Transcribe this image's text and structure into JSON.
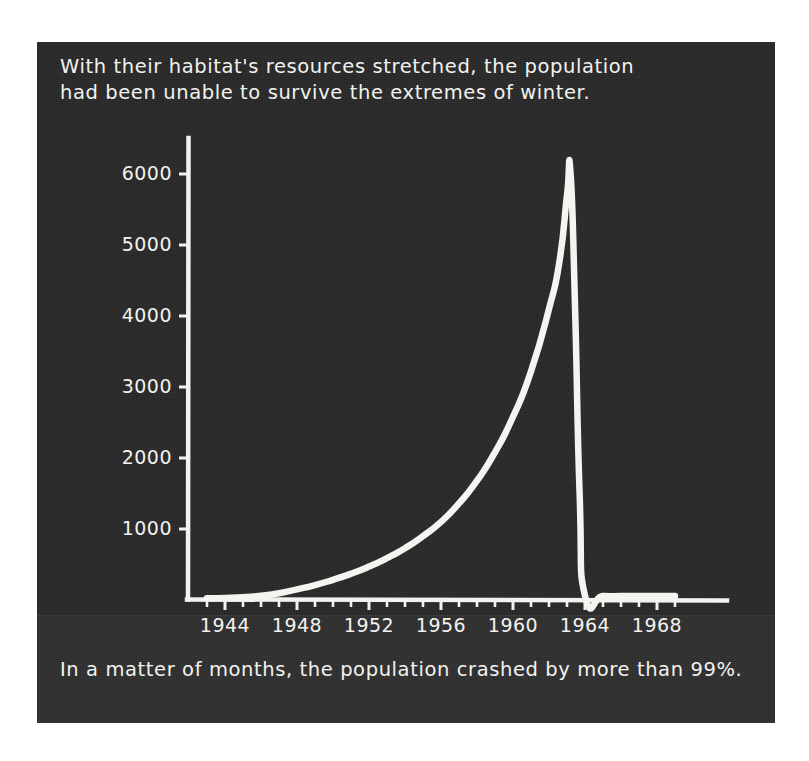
{
  "page": {
    "background_color": "#ffffff",
    "panel_color": "#272727",
    "ink_color": "#f2f2ef"
  },
  "title": "With their habitat's resources stretched, the population\nhad been unable to survive the extremes of winter.",
  "caption": "In a matter of months, the population crashed by more than 99%.",
  "chart_data": {
    "type": "line",
    "title": "",
    "xlabel": "",
    "ylabel": "",
    "xlim": [
      1942.5,
      1969.5
    ],
    "ylim": [
      0,
      6400
    ],
    "grid": false,
    "legend": "none",
    "style": "hand-drawn white line on dark panel",
    "y_ticks": [
      1000,
      2000,
      3000,
      4000,
      5000,
      6000
    ],
    "y_tick_labels": [
      "1000",
      "2000",
      "3000",
      "4000",
      "5000",
      "6000"
    ],
    "x_ticks": [
      1944,
      1948,
      1952,
      1956,
      1960,
      1964,
      1968
    ],
    "x_tick_labels": [
      "1944",
      "1948",
      "1952",
      "1956",
      "1960",
      "1964",
      "1968"
    ],
    "x_minor_tick_interval": 1,
    "series": [
      {
        "name": "population",
        "x": [
          1943.0,
          1944.0,
          1945.0,
          1946.0,
          1947.0,
          1948.0,
          1949.0,
          1950.0,
          1951.0,
          1952.0,
          1953.0,
          1954.0,
          1955.0,
          1956.0,
          1957.0,
          1958.0,
          1959.0,
          1960.0,
          1961.0,
          1962.0,
          1962.6,
          1963.0,
          1963.2,
          1963.45,
          1963.7,
          1964.0,
          1965.0,
          1966.0,
          1967.0,
          1968.0,
          1969.0
        ],
        "values": [
          25,
          30,
          40,
          60,
          95,
          150,
          210,
          285,
          370,
          470,
          590,
          730,
          900,
          1100,
          1360,
          1680,
          2080,
          2580,
          3220,
          4100,
          4800,
          5700,
          6000,
          4100,
          1500,
          60,
          55,
          55,
          55,
          55,
          55
        ]
      }
    ],
    "annotations": {
      "peak_year": 1963,
      "peak_value": 6000,
      "crash_end_year": 1964,
      "crash_end_value": 60,
      "crash_percent": "99%"
    }
  },
  "icons": {
    "chart_line": "line-chart-icon"
  }
}
